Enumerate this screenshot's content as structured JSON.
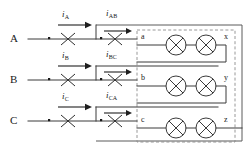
{
  "diagram": {
    "phases": [
      {
        "label": "A",
        "current_primary": "i",
        "current_primary_sub": "A",
        "current_secondary": "i",
        "current_secondary_sub": "AB",
        "terminal_in": "a",
        "terminal_out": "x"
      },
      {
        "label": "B",
        "current_primary": "i",
        "current_primary_sub": "B",
        "current_secondary": "i",
        "current_secondary_sub": "BC",
        "terminal_in": "b",
        "terminal_out": "y"
      },
      {
        "label": "C",
        "current_primary": "i",
        "current_primary_sub": "C",
        "current_secondary": "i",
        "current_secondary_sub": "CA",
        "terminal_in": "c",
        "terminal_out": "z"
      }
    ],
    "colors": {
      "wire": "#3a3a3a",
      "dashed_box": "#8c8c8c",
      "solid_box": "#5a5a5a",
      "text": "#1a1a1a",
      "background": "#ffffff"
    },
    "symbols": {
      "current_transformer": "ct-bowtie-icon",
      "polarity_dot": "polarity-dot-icon",
      "coil": "crossed-circle-coil-icon",
      "arrow": "current-direction-arrow-icon"
    }
  }
}
